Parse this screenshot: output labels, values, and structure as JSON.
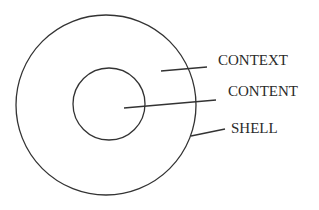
{
  "diagram": {
    "type": "concentric-circles",
    "colors": {
      "background": "#ffffff",
      "stroke": "#333333",
      "text": "#2a2a2a"
    },
    "circles": {
      "outer": {
        "name": "shell",
        "cx": 106,
        "cy": 105,
        "r": 90
      },
      "inner": {
        "name": "content",
        "cx": 109,
        "cy": 104,
        "r": 36
      }
    },
    "labels": [
      {
        "id": "context",
        "text": "CONTEXT",
        "x": 218,
        "y": 65,
        "leader": {
          "x1": 161,
          "y1": 71,
          "x2": 207,
          "y2": 67
        }
      },
      {
        "id": "content",
        "text": "CONTENT",
        "x": 228,
        "y": 96,
        "leader": {
          "x1": 124,
          "y1": 108,
          "x2": 216,
          "y2": 100
        }
      },
      {
        "id": "shell",
        "text": "SHELL",
        "x": 231,
        "y": 133,
        "leader": {
          "x1": 191,
          "y1": 136,
          "x2": 225,
          "y2": 129
        }
      }
    ]
  }
}
